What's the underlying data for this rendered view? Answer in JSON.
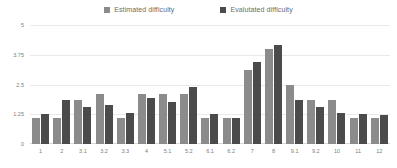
{
  "chart_data": {
    "type": "bar",
    "title": "",
    "subtitle": "",
    "xlabel": "",
    "ylabel": "",
    "ylim": [
      0,
      5
    ],
    "yticks": [
      "0",
      "1.25",
      "2.5",
      "3.75",
      "5"
    ],
    "grid": true,
    "legend_position": "top-center",
    "categories": [
      "1",
      "2",
      "3.1",
      "3.2",
      "3.3",
      "4",
      "5.1",
      "5.2",
      "6.1",
      "6.2",
      "7",
      "8",
      "9.1",
      "9.2",
      "10",
      "11",
      "12"
    ],
    "series": [
      {
        "name": "Estimated difficulty",
        "color": "#8b8b8b",
        "values": [
          1.1,
          1.1,
          1.85,
          2.1,
          1.1,
          2.1,
          2.1,
          2.1,
          1.1,
          1.1,
          3.1,
          4.0,
          2.5,
          1.85,
          1.85,
          1.1,
          1.1
        ]
      },
      {
        "name": "Evalutated difficulty",
        "color": "#4b4b4b",
        "values": [
          1.25,
          1.85,
          1.55,
          1.65,
          1.3,
          1.95,
          1.75,
          2.4,
          1.25,
          1.1,
          3.45,
          4.15,
          1.85,
          1.55,
          1.3,
          1.25,
          1.2
        ]
      }
    ]
  },
  "legend": {
    "items": [
      {
        "label": "Estimated difficulty",
        "color": "#8b8b8b"
      },
      {
        "label": "Evalutated difficulty",
        "color": "#4b4b4b"
      }
    ]
  },
  "colors": {
    "estimated": "#8b8b8b",
    "evaluated": "#4b4b4b",
    "gridline": "#e9e9e9",
    "axis_text": "#7d7d7d",
    "legend_text": "#6b6b6b",
    "background": "#ffffff"
  }
}
